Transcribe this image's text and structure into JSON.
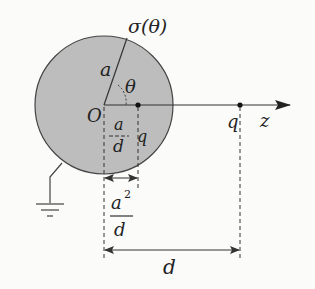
{
  "diagram": {
    "colors": {
      "sphere_fill": "#bdbdbd",
      "stroke": "#333333",
      "background": "#fbfbfa"
    },
    "labels": {
      "surface_charge": "σ(θ)",
      "radius": "a",
      "angle": "θ",
      "origin": "O",
      "image_distance_num": "a",
      "image_distance_den": "d",
      "image_charge": "q",
      "real_charge": "q",
      "axis": "z",
      "image_offset_num": "a",
      "image_offset_sup": "2",
      "image_offset_den": "d",
      "distance": "d"
    },
    "elements": [
      "sphere",
      "radius-line",
      "angle-arc",
      "z-axis",
      "image-charge-dot",
      "real-charge-dot",
      "ground-wire",
      "ground-symbol",
      "dimension-a2-over-d",
      "dimension-d"
    ]
  }
}
